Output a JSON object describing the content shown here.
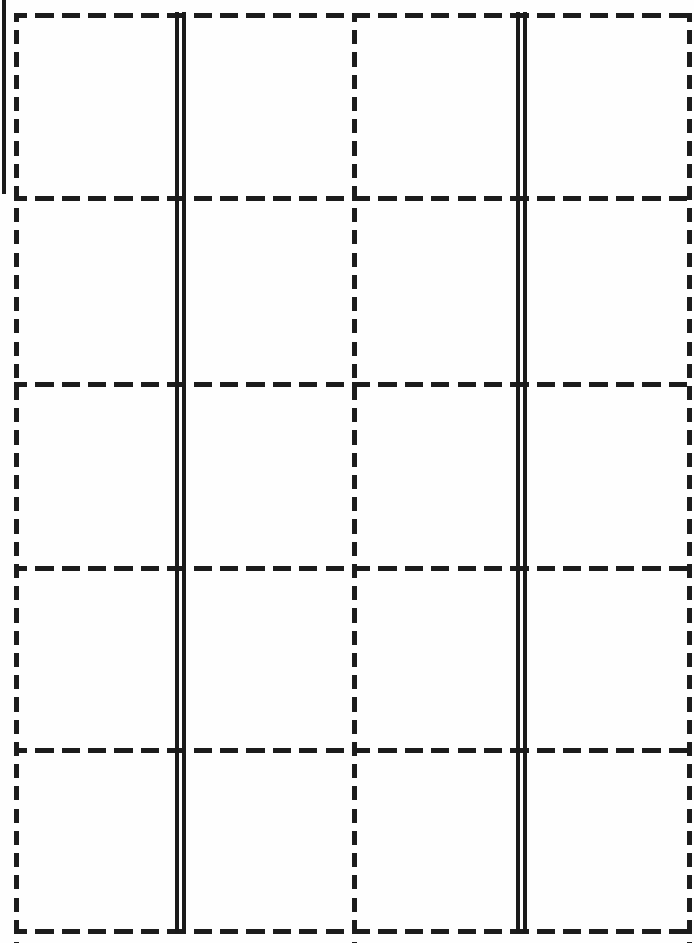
{
  "figure": {
    "kind": "line-art-grid",
    "width": 694,
    "height": 943,
    "background_color": "#fefefe",
    "ink_color": "#1a1a1a"
  },
  "grid": {
    "dash_style": "dashed",
    "dash_length_horizontal": 18,
    "dash_gap_horizontal": 8,
    "dash_length_vertical": 14,
    "dash_gap_vertical": 8,
    "stroke_width_dashed": 5,
    "stroke_width_solid": 4,
    "rows": 5,
    "columns": 4,
    "horizontal_lines": [
      {
        "name": "border-top",
        "y": 13,
        "x_start": 14,
        "x_end": 690,
        "style": "dashed"
      },
      {
        "name": "row-rule-1",
        "y": 196,
        "x_start": 14,
        "x_end": 694,
        "style": "dashed"
      },
      {
        "name": "row-rule-2",
        "y": 382,
        "x_start": 14,
        "x_end": 694,
        "style": "dashed"
      },
      {
        "name": "row-rule-3",
        "y": 566,
        "x_start": 14,
        "x_end": 694,
        "style": "dashed"
      },
      {
        "name": "row-rule-4",
        "y": 748,
        "x_start": 14,
        "x_end": 694,
        "style": "dashed"
      },
      {
        "name": "border-bottom",
        "y": 929,
        "x_start": 14,
        "x_end": 694,
        "style": "dashed"
      }
    ],
    "vertical_lines": [
      {
        "name": "border-left",
        "x": 14,
        "y_start": 13,
        "y_end": 943,
        "style": "dashed"
      },
      {
        "name": "column-rule-1",
        "x": 352,
        "y_start": 13,
        "y_end": 943,
        "style": "dashed"
      },
      {
        "name": "border-right",
        "x": 687,
        "y_start": 13,
        "y_end": 943,
        "style": "dashed"
      }
    ],
    "solid_double_rules": [
      {
        "name": "double-rule-left",
        "lines": [
          {
            "x": 175,
            "width": 4,
            "y_start": 12,
            "y_end": 933
          },
          {
            "x": 182,
            "width": 4,
            "y_start": 12,
            "y_end": 933
          }
        ]
      },
      {
        "name": "double-rule-right",
        "lines": [
          {
            "x": 516,
            "width": 4,
            "y_start": 12,
            "y_end": 933
          },
          {
            "x": 523,
            "width": 4,
            "y_start": 12,
            "y_end": 933
          }
        ]
      }
    ],
    "solid_edge_marks": [
      {
        "name": "left-edge-solid-mark",
        "x": 2,
        "width": 4,
        "y_start": 0,
        "y_end": 194
      }
    ],
    "cells": [
      {
        "row": 1,
        "col": 1,
        "text": ""
      },
      {
        "row": 1,
        "col": 2,
        "text": ""
      },
      {
        "row": 1,
        "col": 3,
        "text": ""
      },
      {
        "row": 1,
        "col": 4,
        "text": ""
      },
      {
        "row": 2,
        "col": 1,
        "text": ""
      },
      {
        "row": 2,
        "col": 2,
        "text": ""
      },
      {
        "row": 2,
        "col": 3,
        "text": ""
      },
      {
        "row": 2,
        "col": 4,
        "text": ""
      },
      {
        "row": 3,
        "col": 1,
        "text": ""
      },
      {
        "row": 3,
        "col": 2,
        "text": ""
      },
      {
        "row": 3,
        "col": 3,
        "text": ""
      },
      {
        "row": 3,
        "col": 4,
        "text": ""
      },
      {
        "row": 4,
        "col": 1,
        "text": ""
      },
      {
        "row": 4,
        "col": 2,
        "text": ""
      },
      {
        "row": 4,
        "col": 3,
        "text": ""
      },
      {
        "row": 4,
        "col": 4,
        "text": ""
      },
      {
        "row": 5,
        "col": 1,
        "text": ""
      },
      {
        "row": 5,
        "col": 2,
        "text": ""
      },
      {
        "row": 5,
        "col": 3,
        "text": ""
      },
      {
        "row": 5,
        "col": 4,
        "text": ""
      }
    ]
  }
}
